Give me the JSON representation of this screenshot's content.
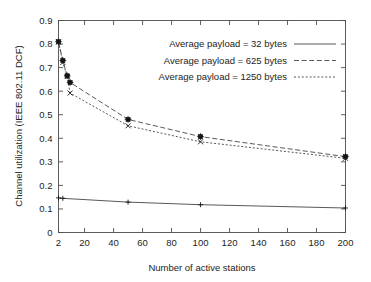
{
  "chart_data": {
    "type": "line",
    "title": "",
    "xlabel": "Number of active stations",
    "ylabel": "Channel utilization (IEEE 802.11 DCF)",
    "xlim": [
      2,
      200
    ],
    "ylim": [
      0,
      0.9
    ],
    "grid": false,
    "legend_position": "top-right-inside",
    "xticks": [
      "2",
      "20",
      "40",
      "60",
      "80",
      "100",
      "120",
      "140",
      "160",
      "180",
      "200"
    ],
    "xtick_values": [
      2,
      20,
      40,
      60,
      80,
      100,
      120,
      140,
      160,
      180,
      200
    ],
    "yticks": [
      "0",
      "0.1",
      "0.2",
      "0.3",
      "0.4",
      "0.5",
      "0.6",
      "0.7",
      "0.8",
      "0.9"
    ],
    "ytick_values": [
      0,
      0.1,
      0.2,
      0.3,
      0.4,
      0.5,
      0.6,
      0.7,
      0.8,
      0.9
    ],
    "x": [
      2,
      5,
      8,
      10,
      50,
      100,
      200
    ],
    "series": [
      {
        "name": "Average payload = 32 bytes",
        "style": "solid",
        "marker": "plus",
        "x": [
          2,
          5,
          50,
          100,
          200
        ],
        "values": [
          0.147,
          0.145,
          0.129,
          0.118,
          0.104
        ]
      },
      {
        "name": "Average payload = 625 bytes",
        "style": "dashed",
        "marker": "square-star",
        "x": [
          2,
          5,
          8,
          10,
          50,
          100,
          200
        ],
        "values": [
          0.81,
          0.73,
          0.665,
          0.637,
          0.48,
          0.407,
          0.322
        ]
      },
      {
        "name": "Average payload = 1250 bytes",
        "style": "dotted",
        "marker": "cross",
        "x": [
          2,
          5,
          8,
          10,
          50,
          100,
          200
        ],
        "values": [
          0.808,
          0.722,
          0.662,
          0.592,
          0.453,
          0.385,
          0.315
        ]
      }
    ],
    "colors": {
      "axis": "#4d4d4d",
      "text": "#242424",
      "line": "#3a3a3a",
      "marker": "#151515",
      "background": "#ffffff"
    }
  }
}
